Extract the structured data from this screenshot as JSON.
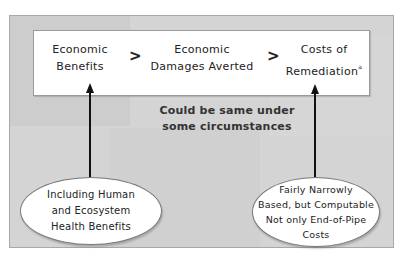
{
  "diagram": {
    "terms": [
      {
        "line1": "Economic",
        "line2": "Benefits"
      },
      {
        "line1": "Economic",
        "line2": "Damages Averted"
      },
      {
        "line1": "Costs of",
        "line2": "Remediation",
        "footnote": "a"
      }
    ],
    "comparators": [
      ">",
      ">"
    ],
    "note": {
      "line1": "Could be same under",
      "line2": "some circumstances"
    },
    "left_callout": {
      "lines": [
        "Including Human",
        "and Ecosystem",
        "Health Benefits"
      ]
    },
    "right_callout": {
      "lines": [
        "Fairly Narrowly",
        "Based, but Computable",
        "Not only End-of-Pipe",
        "Costs"
      ]
    },
    "colors": {
      "panel": "#d4d4d4",
      "box": "#ffffff",
      "arrow": "#111111"
    }
  }
}
